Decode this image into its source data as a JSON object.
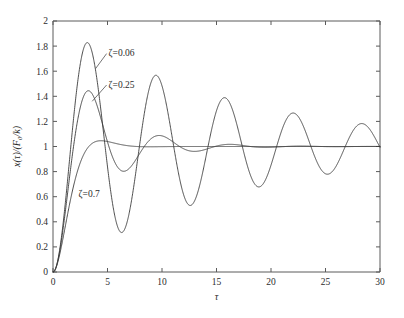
{
  "chart_data": {
    "type": "line",
    "title": "",
    "subtitle": "",
    "xlabel": "τ",
    "ylabel": "x(τ)/(F₀/k)",
    "xlim": [
      0,
      30
    ],
    "ylim": [
      0,
      2
    ],
    "xticks": [
      "0",
      "5",
      "10",
      "15",
      "20",
      "25",
      "30"
    ],
    "xtick_values": [
      0,
      5,
      10,
      15,
      20,
      25,
      30
    ],
    "yticks": [
      "0",
      "0.2",
      "0.4",
      "0.6",
      "0.8",
      "1",
      "1.2",
      "1.4",
      "1.6",
      "1.8",
      "2"
    ],
    "ytick_values": [
      0,
      0.2,
      0.4,
      0.6,
      0.8,
      1.0,
      1.2,
      1.4,
      1.6,
      1.8,
      2.0
    ],
    "grid": false,
    "legend_position": "inline-annotations",
    "line_color": "#3a3a3a",
    "axis_color": "#5a5a5a",
    "background_color": "#ffffff",
    "series": [
      {
        "name": "ζ=0.06",
        "zeta": 0.06,
        "annotation": "ζ=0.06",
        "annotation_x": 5.1,
        "annotation_y": 1.72,
        "leader_to_x": 3.9,
        "leader_to_y": 1.62,
        "peaks": [
          {
            "x": 3.15,
            "y": 1.82
          },
          {
            "x": 9.45,
            "y": 1.56
          },
          {
            "x": 15.7,
            "y": 1.385
          },
          {
            "x": 22.0,
            "y": 1.26
          },
          {
            "x": 28.3,
            "y": 1.175
          }
        ],
        "troughs": [
          {
            "x": 6.3,
            "y": 0.32
          },
          {
            "x": 12.6,
            "y": 0.525
          },
          {
            "x": 18.85,
            "y": 0.675
          },
          {
            "x": 25.1,
            "y": 0.78
          }
        ]
      },
      {
        "name": "ζ=0.25",
        "zeta": 0.25,
        "annotation": "ζ=0.25",
        "annotation_x": 5.1,
        "annotation_y": 1.47,
        "leader_to_x": 3.6,
        "leader_to_y": 1.36,
        "peaks": [
          {
            "x": 3.25,
            "y": 1.445
          },
          {
            "x": 9.7,
            "y": 1.085
          },
          {
            "x": 16.2,
            "y": 1.018
          }
        ],
        "troughs": [
          {
            "x": 6.5,
            "y": 0.8
          },
          {
            "x": 13.0,
            "y": 0.962
          }
        ]
      },
      {
        "name": "ζ=0.7",
        "zeta": 0.7,
        "annotation": "ζ=0.7",
        "annotation_x": 2.35,
        "annotation_y": 0.6,
        "peaks": [
          {
            "x": 4.4,
            "y": 1.045
          }
        ],
        "troughs": []
      }
    ]
  },
  "annotations": {
    "zeta_006": "ζ=0.06",
    "zeta_025": "ζ=0.25",
    "zeta_07": "ζ=0.7"
  },
  "axis": {
    "x_title": "τ",
    "y_title_num": "x(τ)",
    "y_title_den": "(F₀/k)",
    "y_title_full": "x(τ)/(F₀/k)"
  }
}
